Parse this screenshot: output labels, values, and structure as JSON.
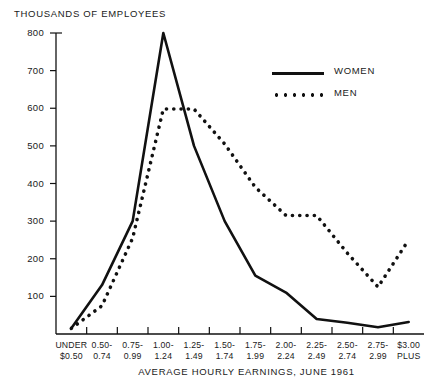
{
  "chart_data": {
    "type": "line",
    "title": "",
    "ylabel": "THOUSANDS OF EMPLOYEES",
    "xlabel": "AVERAGE HOURLY EARNINGS, JUNE 1961",
    "categories": [
      "UNDER $0.50",
      "0.50-0.74",
      "0.75-0.99",
      "1.00-1.24",
      "1.25-1.49",
      "1.50-1.74",
      "1.75-1.99",
      "2.00-2.24",
      "2.25-2.49",
      "2.50-2.74",
      "2.75-2.99",
      "$3.00 PLUS"
    ],
    "category_lines": [
      [
        "UNDER",
        "$0.50"
      ],
      [
        "0.50-",
        "0.74"
      ],
      [
        "0.75-",
        "0.99"
      ],
      [
        "1.00-",
        "1.24"
      ],
      [
        "1.25-",
        "1.49"
      ],
      [
        "1.50-",
        "1.74"
      ],
      [
        "1.75-",
        "1.99"
      ],
      [
        "2.00-",
        "2.24"
      ],
      [
        "2.25-",
        "2.49"
      ],
      [
        "2.50-",
        "2.74"
      ],
      [
        "2.75-",
        "2.99"
      ],
      [
        "$3.00",
        "PLUS"
      ]
    ],
    "series": [
      {
        "name": "WOMEN",
        "style": "solid",
        "color": "#111111",
        "values": [
          15,
          130,
          300,
          800,
          500,
          300,
          155,
          110,
          40,
          30,
          18,
          32
        ]
      },
      {
        "name": "MEN",
        "style": "dotted",
        "color": "#111111",
        "values": [
          15,
          75,
          255,
          598,
          598,
          505,
          390,
          315,
          315,
          215,
          125,
          250
        ]
      }
    ],
    "yticks": [
      0,
      100,
      200,
      300,
      400,
      500,
      600,
      700,
      800
    ],
    "ytick_labels": [
      "",
      "100",
      "200",
      "300",
      "400",
      "500",
      "600",
      "700",
      "800"
    ],
    "ylim": [
      0,
      800
    ],
    "grid": false,
    "legend_position": "upper-right",
    "legend": [
      {
        "label": "WOMEN",
        "style": "solid"
      },
      {
        "label": "MEN",
        "style": "dotted"
      }
    ]
  }
}
